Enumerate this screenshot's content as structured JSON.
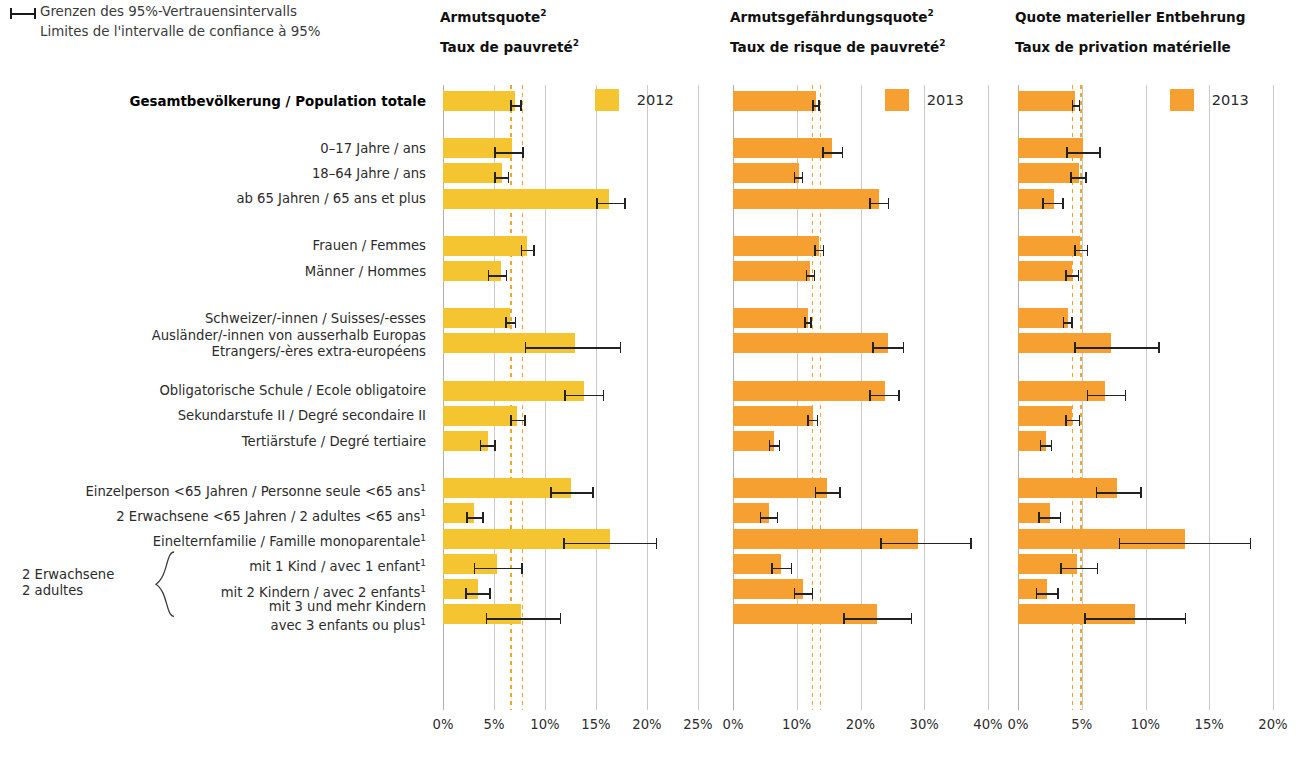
{
  "legend_ci": {
    "line_de": "Grenzen des 95%-Vertrauensintervalls",
    "line_fr": "Limites de l'intervalle de confiance à 95%",
    "glyph": "error-bar-glyph"
  },
  "panels": [
    {
      "id": "armutsquote",
      "title_de": "Armutsquote",
      "title_de_sup": "2",
      "title_fr": "Taux de pauvreté",
      "title_fr_sup": "2",
      "year": "2012",
      "color": "#F5C431",
      "axis": {
        "min": 0,
        "max": 25,
        "step": 5,
        "ticks": [
          "0%",
          "5%",
          "10%",
          "15%",
          "20%",
          "25%"
        ]
      },
      "reference_lines": [
        6.6,
        7.7
      ]
    },
    {
      "id": "armutsgefaehrdungsquote",
      "title_de": "Armutsgefährdungsquote",
      "title_de_sup": "2",
      "title_fr": "Taux de risque de pauvreté",
      "title_fr_sup": "2",
      "year": "2013",
      "color": "#F5A030",
      "axis": {
        "min": 0,
        "max": 40,
        "step": 10,
        "ticks": [
          "0%",
          "10%",
          "20%",
          "30%",
          "40%"
        ]
      },
      "reference_lines": [
        12.4,
        13.6
      ]
    },
    {
      "id": "quote-materieller-entbehrung",
      "title_de": "Quote materieller Entbehrung",
      "title_de_sup": "",
      "title_fr": "Taux de privation matérielle",
      "title_fr_sup": "",
      "year": "2013",
      "color": "#F5A030",
      "axis": {
        "min": 0,
        "max": 20,
        "step": 5,
        "ticks": [
          "0%",
          "5%",
          "10%",
          "15%",
          "20%"
        ]
      },
      "reference_lines": [
        4.2,
        4.9
      ]
    }
  ],
  "brace_group": {
    "line1": "2 Erwachsene",
    "line2": "2 adultes"
  },
  "chart_data": {
    "type": "bar",
    "orientation": "horizontal",
    "xlabel": "",
    "ylabel": "",
    "grid": true,
    "legend_position": "top-right-of-each-panel",
    "categories": [
      "Gesamtbevölkerung / Population totale",
      "0–17 Jahre / ans",
      "18–64 Jahre / ans",
      "ab 65 Jahren / 65 ans et plus",
      "Frauen / Femmes",
      "Männer / Hommes",
      "Schweizer/-innen / Suisses/-esses",
      "Ausländer/-innen von ausserhalb Europas / Etrangers/-ères extra-européens",
      "Obligatorische Schule / Ecole obligatoire",
      "Sekundarstufe II / Degré secondaire II",
      "Tertiärstufe / Degré tertiaire",
      "Einzelperson <65 Jahren / Personne seule <65 ans",
      "2 Erwachsene <65 Jahren / 2 adultes <65 ans",
      "Einelternfamilie / Famille monoparentale",
      "mit 1 Kind / avec 1 enfant",
      "mit 2 Kindern / avec 2 enfants",
      "mit 3 und mehr Kindern / avec 3 enfants ou plus"
    ],
    "series": [
      {
        "name": "Armutsquote / Taux de pauvreté",
        "year": "2012",
        "unit": "%",
        "xmax": 25,
        "values": [
          7.1,
          6.8,
          5.8,
          16.3,
          8.2,
          5.7,
          6.6,
          12.9,
          13.8,
          7.3,
          4.4,
          12.5,
          3.0,
          16.4,
          5.3,
          3.4,
          7.6
        ],
        "ci_low": [
          6.6,
          5.0,
          5.0,
          15.0,
          7.6,
          4.4,
          6.1,
          8.0,
          11.9,
          6.6,
          3.6,
          10.5,
          2.3,
          11.8,
          3.0,
          2.2,
          4.2
        ],
        "ci_high": [
          7.7,
          7.9,
          6.5,
          17.9,
          9.0,
          6.3,
          7.2,
          17.5,
          15.8,
          8.1,
          5.2,
          14.8,
          4.0,
          21.0,
          7.8,
          4.7,
          11.6
        ]
      },
      {
        "name": "Armutsgefährdungsquote / Taux de risque de pauvreté",
        "year": "2013",
        "unit": "%",
        "xmax": 40,
        "values": [
          13.0,
          15.6,
          10.3,
          22.9,
          13.5,
          12.1,
          11.8,
          24.3,
          23.8,
          12.5,
          6.5,
          14.8,
          5.6,
          29.0,
          7.6,
          11.0,
          22.6
        ],
        "ci_low": [
          12.4,
          14.0,
          9.5,
          21.4,
          12.7,
          11.4,
          11.2,
          21.8,
          21.4,
          11.6,
          5.6,
          12.8,
          4.2,
          23.1,
          6.0,
          9.5,
          17.3
        ],
        "ci_high": [
          13.6,
          17.3,
          11.0,
          24.5,
          14.3,
          12.9,
          12.4,
          26.9,
          26.2,
          13.4,
          7.4,
          16.9,
          7.1,
          37.5,
          9.3,
          12.6,
          28.1
        ]
      },
      {
        "name": "Quote materieller Entbehrung / Taux de privation matérielle",
        "year": "2013",
        "unit": "%",
        "xmax": 20,
        "values": [
          4.5,
          5.1,
          4.8,
          2.8,
          4.9,
          4.2,
          3.9,
          7.3,
          6.8,
          4.2,
          2.2,
          7.8,
          2.5,
          13.1,
          4.6,
          2.3,
          9.2
        ],
        "ci_low": [
          4.2,
          3.8,
          4.1,
          1.9,
          4.4,
          3.7,
          3.5,
          4.4,
          5.4,
          3.7,
          1.7,
          6.1,
          1.6,
          7.9,
          3.3,
          1.4,
          5.2
        ],
        "ci_high": [
          4.9,
          6.5,
          5.4,
          3.6,
          5.5,
          4.8,
          4.3,
          11.1,
          8.5,
          4.9,
          2.7,
          9.7,
          3.4,
          18.3,
          6.3,
          3.2,
          13.2
        ]
      }
    ],
    "group_gaps_after_row": [
      0,
      3,
      5,
      7,
      10
    ]
  },
  "row_labels": [
    {
      "lines": [
        "Gesamtbevölkerung / Population totale"
      ],
      "bold": true,
      "sup": ""
    },
    {
      "lines": [
        "0–17 Jahre / ans"
      ],
      "bold": false,
      "sup": ""
    },
    {
      "lines": [
        "18–64 Jahre / ans"
      ],
      "bold": false,
      "sup": ""
    },
    {
      "lines": [
        "ab 65 Jahren / 65 ans et plus"
      ],
      "bold": false,
      "sup": ""
    },
    {
      "lines": [
        "Frauen / Femmes"
      ],
      "bold": false,
      "sup": ""
    },
    {
      "lines": [
        "Männer / Hommes"
      ],
      "bold": false,
      "sup": ""
    },
    {
      "lines": [
        "Schweizer/-innen / Suisses/-esses"
      ],
      "bold": false,
      "sup": ""
    },
    {
      "lines": [
        "Ausländer/-innen von ausserhalb Europas",
        "Etrangers/-ères extra-européens"
      ],
      "bold": false,
      "sup": ""
    },
    {
      "lines": [
        "Obligatorische Schule / Ecole obligatoire"
      ],
      "bold": false,
      "sup": ""
    },
    {
      "lines": [
        "Sekundarstufe II / Degré secondaire II"
      ],
      "bold": false,
      "sup": ""
    },
    {
      "lines": [
        "Tertiärstufe / Degré tertiaire"
      ],
      "bold": false,
      "sup": ""
    },
    {
      "lines": [
        "Einzelperson <65 Jahren / Personne seule <65 ans"
      ],
      "bold": false,
      "sup": "1"
    },
    {
      "lines": [
        "2 Erwachsene <65 Jahren / 2 adultes <65 ans"
      ],
      "bold": false,
      "sup": "1"
    },
    {
      "lines": [
        "Einelternfamilie / Famille monoparentale"
      ],
      "bold": false,
      "sup": "1"
    },
    {
      "lines": [
        "mit 1 Kind / avec 1 enfant"
      ],
      "bold": false,
      "sup": "1"
    },
    {
      "lines": [
        "mit 2 Kindern / avec 2 enfants"
      ],
      "bold": false,
      "sup": "1"
    },
    {
      "lines": [
        "mit 3 und mehr Kindern",
        "avec 3 enfants ou plus"
      ],
      "bold": false,
      "sup": "1"
    }
  ]
}
